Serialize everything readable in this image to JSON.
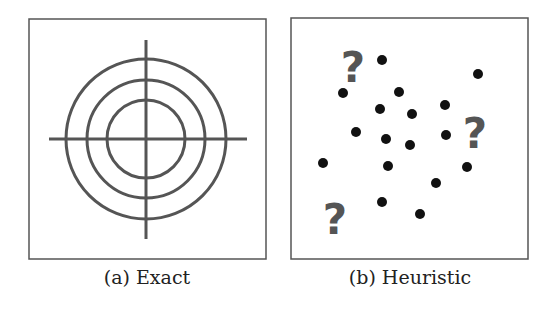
{
  "panels": [
    {
      "id": "a",
      "caption": "(a) Exact",
      "frame": {
        "x": 29,
        "y": 19,
        "w": 237,
        "h": 240
      },
      "target": {
        "cx": 146,
        "cy": 139,
        "radii": [
          39,
          59,
          80
        ],
        "h_line": [
          49,
          247
        ],
        "v_line": [
          40,
          239
        ]
      }
    },
    {
      "id": "b",
      "caption": "(b) Heuristic",
      "frame": {
        "x": 291,
        "y": 18,
        "w": 237,
        "h": 241
      },
      "dots": [
        [
          382,
          60
        ],
        [
          478,
          74
        ],
        [
          343,
          93
        ],
        [
          399,
          92
        ],
        [
          380,
          109
        ],
        [
          412,
          114
        ],
        [
          445,
          105
        ],
        [
          356,
          132
        ],
        [
          386,
          139
        ],
        [
          410,
          145
        ],
        [
          446,
          135
        ],
        [
          323,
          163
        ],
        [
          388,
          166
        ],
        [
          467,
          167
        ],
        [
          436,
          183
        ],
        [
          382,
          202
        ],
        [
          420,
          214
        ]
      ],
      "question_marks": [
        {
          "text": "?",
          "x": 353,
          "y": 82
        },
        {
          "text": "?",
          "x": 475,
          "y": 148
        },
        {
          "text": "?",
          "x": 335,
          "y": 234
        }
      ]
    }
  ],
  "colors": {
    "stroke": "#555555",
    "frame": "#555555",
    "dot": "#111111"
  }
}
